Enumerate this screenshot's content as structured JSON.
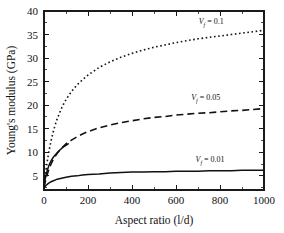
{
  "chart_data": {
    "type": "line",
    "title": "",
    "xlabel": "Aspect ratio (l/d)",
    "ylabel": "Young's modulus (GPa)",
    "xlim": [
      0,
      1000
    ],
    "ylim": [
      2,
      40
    ],
    "grid": false,
    "legend_position": "inline-annotations",
    "xticks": [
      0,
      200,
      400,
      600,
      800,
      1000
    ],
    "xticklabels": [
      "0",
      "200",
      "400",
      "600",
      "800",
      "1000"
    ],
    "yticks": [
      5,
      10,
      15,
      20,
      25,
      30,
      35,
      40
    ],
    "yticklabels": [
      "5",
      "10",
      "15",
      "20",
      "25",
      "30",
      "35",
      "40"
    ],
    "x": [
      0,
      10,
      20,
      30,
      40,
      50,
      60,
      80,
      100,
      125,
      150,
      175,
      200,
      250,
      300,
      350,
      400,
      450,
      500,
      550,
      600,
      650,
      700,
      750,
      800,
      850,
      900,
      950,
      1000
    ],
    "series": [
      {
        "name": "Vf = 0.1",
        "label_main": "V",
        "label_sub": "f",
        "label_rest": " = 0.1",
        "linestyle": "dotted",
        "color": "#111111",
        "label_x": 760,
        "label_y": 37.3,
        "values": [
          2.8,
          6.6,
          9.6,
          12.0,
          14.0,
          15.7,
          17.1,
          19.4,
          21.2,
          22.9,
          24.3,
          25.4,
          26.4,
          28.0,
          29.2,
          30.2,
          31.0,
          31.7,
          32.3,
          32.8,
          33.3,
          33.7,
          34.1,
          34.4,
          34.7,
          35.0,
          35.3,
          35.6,
          35.9
        ]
      },
      {
        "name": "Vf = 0.05",
        "label_main": "V",
        "label_sub": "f",
        "label_rest": " = 0.05",
        "linestyle": "dashed",
        "color": "#111111",
        "label_x": 735,
        "label_y": 21.2,
        "values": [
          2.6,
          4.6,
          6.1,
          7.3,
          8.3,
          9.1,
          9.8,
          10.9,
          11.8,
          12.6,
          13.3,
          13.9,
          14.4,
          15.2,
          15.8,
          16.3,
          16.7,
          17.1,
          17.4,
          17.6,
          17.9,
          18.1,
          18.3,
          18.4,
          18.6,
          18.8,
          18.9,
          19.1,
          19.3
        ]
      },
      {
        "name": "Vf = 0.01",
        "label_main": "V",
        "label_sub": "f",
        "label_rest": " = 0.01",
        "linestyle": "solid",
        "color": "#111111",
        "label_x": 755,
        "label_y": 7.9,
        "values": [
          2.5,
          3.0,
          3.4,
          3.7,
          3.9,
          4.1,
          4.3,
          4.5,
          4.7,
          4.9,
          5.0,
          5.2,
          5.3,
          5.4,
          5.6,
          5.7,
          5.8,
          5.8,
          5.9,
          5.9,
          6.0,
          6.0,
          6.0,
          6.1,
          6.1,
          6.1,
          6.2,
          6.2,
          6.2
        ]
      },
      {
        "name": "partial-solid-branch",
        "linestyle": "solid",
        "color": "#111111",
        "truncated": true,
        "x": [
          0,
          5,
          10,
          15,
          20,
          25,
          30,
          40,
          50,
          60,
          70,
          80,
          90,
          100,
          110
        ],
        "values": [
          2.6,
          4.2,
          5.3,
          6.2,
          6.9,
          7.5,
          8.0,
          8.8,
          9.4,
          9.9,
          10.4,
          10.8,
          11.2,
          11.5,
          11.8
        ]
      }
    ]
  },
  "axes": {
    "ylabel": "Young's modulus (GPa)",
    "xlabel": "Aspect ratio (l/d)"
  }
}
